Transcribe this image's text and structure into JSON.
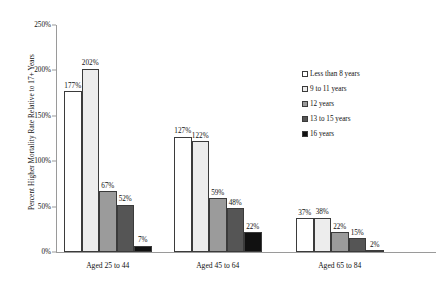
{
  "chart_data": {
    "type": "bar",
    "title": "",
    "xlabel": "",
    "ylabel": "Percent Higher Mortality Rate Relative to 17+ Years",
    "ylim": [
      0,
      250
    ],
    "ytick_labels": [
      "0%",
      "50%",
      "100%",
      "150%",
      "200%",
      "250%"
    ],
    "ytick_values": [
      0,
      50,
      100,
      150,
      200,
      250
    ],
    "grid": false,
    "legend_position": "right",
    "categories": [
      "Aged 25 to 44",
      "Aged 45 to 64",
      "Aged 65 to 84"
    ],
    "series": [
      {
        "name": "Less than 8 years",
        "color": "#ffffff",
        "values": [
          177,
          127,
          37
        ],
        "labels": [
          "177%",
          "127%",
          "37%"
        ]
      },
      {
        "name": "9 to 11 years",
        "color": "#ededed",
        "values": [
          202,
          122,
          38
        ],
        "labels": [
          "202%",
          "122%",
          "38%"
        ]
      },
      {
        "name": "12 years",
        "color": "#9b9b9b",
        "values": [
          67,
          59,
          22
        ],
        "labels": [
          "67%",
          "59%",
          "22%"
        ]
      },
      {
        "name": "13 to 15 years",
        "color": "#555555",
        "values": [
          52,
          48,
          15
        ],
        "labels": [
          "52%",
          "48%",
          "15%"
        ]
      },
      {
        "name": "16 years",
        "color": "#111111",
        "values": [
          7,
          22,
          2
        ],
        "labels": [
          "7%",
          "22%",
          "2%"
        ]
      }
    ]
  },
  "legend": {
    "items": [
      {
        "label": "Less than 8 years",
        "color": "#ffffff"
      },
      {
        "label": "9 to 11 years",
        "color": "#ededed"
      },
      {
        "label": "12 years",
        "color": "#9b9b9b"
      },
      {
        "label": "13 to 15 years",
        "color": "#555555"
      },
      {
        "label": "16 years",
        "color": "#111111"
      }
    ]
  }
}
